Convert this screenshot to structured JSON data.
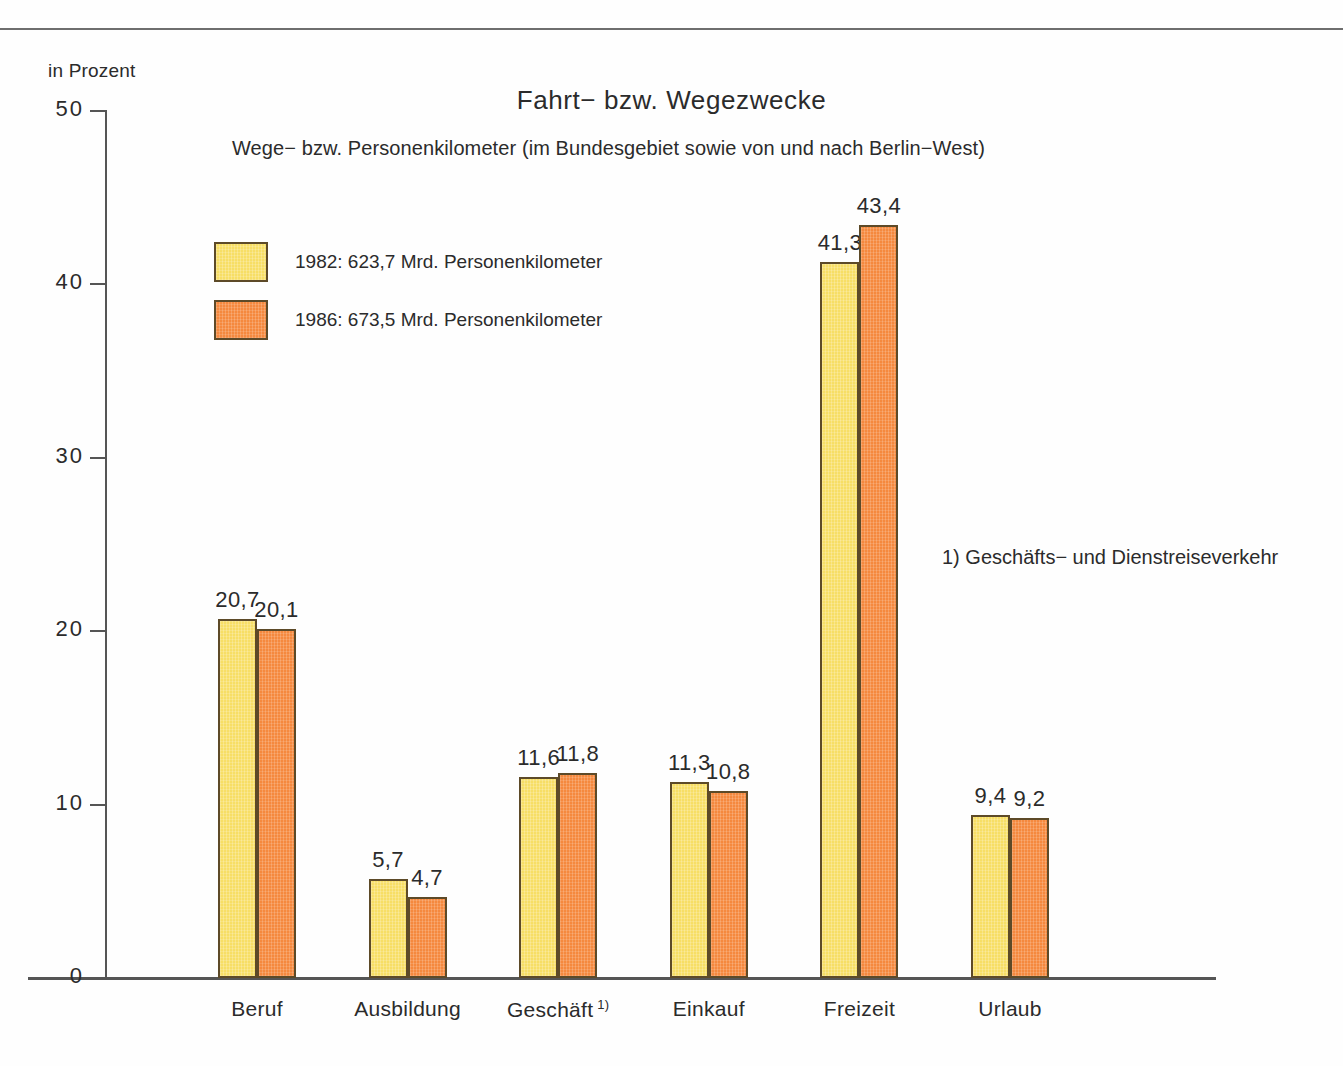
{
  "axis_unit_label": "in Prozent",
  "title": "Fahrt− bzw. Wegezwecke",
  "subtitle": "Wege− bzw. Personenkilometer (im Bundesgebiet sowie von und nach Berlin−West)",
  "footnote": "1) Geschäfts− und Dienstreiseverkehr",
  "legend": {
    "position": "inside-top-left",
    "items": [
      {
        "label": "1982: 623,7 Mrd. Personenkilometer",
        "color": "#F7DE65"
      },
      {
        "label": "1986: 673,5 Mrd. Personenkilometer",
        "color": "#F5893E"
      }
    ]
  },
  "colors": {
    "series_1982": "#F7DE65",
    "series_1986": "#F5893E",
    "bar_outline": "#5D4A28",
    "axis": "#555555",
    "text": "#2B2B2B"
  },
  "chart_data": {
    "type": "bar",
    "title": "Fahrt− bzw. Wegezwecke",
    "subtitle": "Wege− bzw. Personenkilometer (im Bundesgebiet sowie von und nach Berlin−West)",
    "xlabel": "",
    "ylabel": "in Prozent",
    "ylim": [
      0,
      50
    ],
    "yticks": [
      "0",
      "10",
      "20",
      "30",
      "40",
      "50"
    ],
    "grid": false,
    "legend_position": "upper left inside",
    "categories": [
      "Beruf",
      "Ausbildung",
      "Geschäft",
      "Einkauf",
      "Freizeit",
      "Urlaub"
    ],
    "category_footnote_markers": [
      "",
      "",
      "1)",
      "",
      "",
      ""
    ],
    "series": [
      {
        "name": "1982: 623,7 Mrd. Personenkilometer",
        "color": "#F7DE65",
        "values": [
          20.7,
          5.7,
          11.6,
          11.3,
          41.3,
          9.4
        ],
        "value_labels": [
          "20,7",
          "5,7",
          "11,6",
          "11,3",
          "41,3",
          "9,4"
        ]
      },
      {
        "name": "1986: 673,5 Mrd. Personenkilometer",
        "color": "#F5893E",
        "values": [
          20.1,
          4.7,
          11.8,
          10.8,
          43.4,
          9.2
        ],
        "value_labels": [
          "20,1",
          "4,7",
          "11,8",
          "10,8",
          "43,4",
          "9,2"
        ]
      }
    ],
    "annotations": [
      "1) Geschäfts− und Dienstreiseverkehr"
    ]
  }
}
